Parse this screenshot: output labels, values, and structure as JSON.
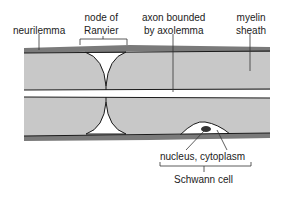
{
  "diagram": {
    "labels": {
      "neurilemma": "neurilemma",
      "node_line1": "node of",
      "node_line2": "Ranvier",
      "axon_line1": "axon bounded",
      "axon_line2": "by axolemma",
      "myelin_line1": "myelin",
      "myelin_line2": "sheath",
      "nucleus": "nucleus, cytoplasm",
      "schwann": "Schwann cell"
    },
    "colors": {
      "myelin": "#c8c8c8",
      "neurilemma": "#7a7a7a",
      "outline": "#1a1a1a",
      "background": "#ffffff"
    }
  }
}
